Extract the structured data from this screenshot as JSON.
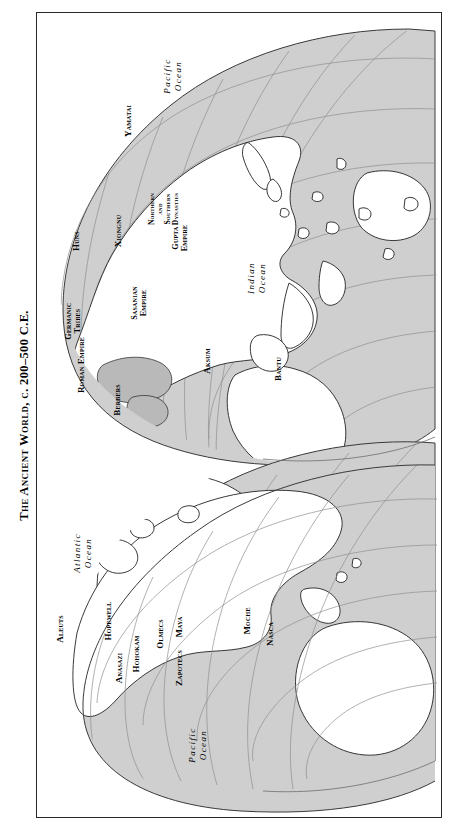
{
  "page": {
    "title": "The Ancient World, c. 200–500 C.E.",
    "background_color": "#ffffff",
    "frame_color": "#2a2a2a"
  },
  "map": {
    "projection": "interrupted globular / orange-peel gores",
    "land_color": "#ffffff",
    "ocean_color": "#cfcfcf",
    "graticule_color": "#8a8a8a",
    "coast_color": "#222222",
    "highlight_color": "#b8b8b8",
    "orientation": "page rotated 90 degrees; labels read bottom-to-top",
    "hemispheres": [
      {
        "name": "eastern-hemisphere",
        "position": "upper"
      },
      {
        "name": "western-hemisphere",
        "position": "lower"
      }
    ],
    "oceans": [
      {
        "name": "pacific-ocean-north",
        "label": "Pacific\nOcean"
      },
      {
        "name": "indian-ocean",
        "label": "Indian\nOcean"
      },
      {
        "name": "atlantic-ocean",
        "label": "Atlantic\nOcean"
      },
      {
        "name": "pacific-ocean-south",
        "label": "Pacific\nOcean"
      }
    ],
    "labels_eastern": [
      {
        "name": "label-yamatai",
        "text": "Yamatai"
      },
      {
        "name": "label-xiongnu",
        "text": "Xiongnu"
      },
      {
        "name": "label-northern-southern-dynasties",
        "text": "Northern\nand\nSouthern\nDynasties"
      },
      {
        "name": "label-gupta-empire",
        "text": "Gupta\nEmpire"
      },
      {
        "name": "label-huns",
        "text": "Huns"
      },
      {
        "name": "label-germanic-tribes",
        "text": "Germanic\nTribes"
      },
      {
        "name": "label-sasanian-empire",
        "text": "Sasanian\nEmpire"
      },
      {
        "name": "label-roman-empire",
        "text": "Roman Empire"
      },
      {
        "name": "label-berbers",
        "text": "Berbers"
      },
      {
        "name": "label-aksum",
        "text": "Aksum"
      },
      {
        "name": "label-bantu",
        "text": "Bantu"
      }
    ],
    "labels_western": [
      {
        "name": "label-aleuts",
        "text": "Aleuts"
      },
      {
        "name": "label-anasazi",
        "text": "Anasazi"
      },
      {
        "name": "label-hopewell",
        "text": "Hopewell"
      },
      {
        "name": "label-hohokam",
        "text": "Hohokam"
      },
      {
        "name": "label-olmecs",
        "text": "Olmecs"
      },
      {
        "name": "label-zapotecs",
        "text": "Zapotecs"
      },
      {
        "name": "label-maya",
        "text": "Maya"
      },
      {
        "name": "label-moche",
        "text": "Moche"
      },
      {
        "name": "label-nasca",
        "text": "Nasca"
      }
    ]
  }
}
